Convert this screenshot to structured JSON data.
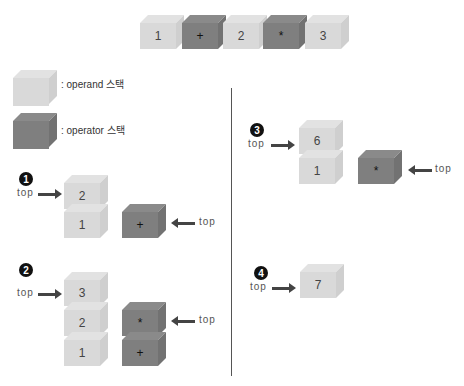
{
  "expression": {
    "tokens": [
      {
        "value": "1",
        "kind": "operand"
      },
      {
        "value": "+",
        "kind": "operator"
      },
      {
        "value": "2",
        "kind": "operand"
      },
      {
        "value": "*",
        "kind": "operator"
      },
      {
        "value": "3",
        "kind": "operand"
      }
    ]
  },
  "legend": {
    "operand_label": ": operand 스택",
    "operator_label": ": operator 스택"
  },
  "colors": {
    "operand": "#d9d9d9",
    "operator": "#7f7f7f"
  },
  "top_label": "top",
  "steps": [
    {
      "number": "1",
      "operand_stack": [
        "2",
        "1"
      ],
      "operator_stack": [
        "+"
      ]
    },
    {
      "number": "2",
      "operand_stack": [
        "3",
        "2",
        "1"
      ],
      "operator_stack": [
        "*",
        "+"
      ]
    },
    {
      "number": "3",
      "operand_stack": [
        "6",
        "1"
      ],
      "operator_stack": [
        "*"
      ]
    },
    {
      "number": "4",
      "operand_stack": [
        "7"
      ],
      "operator_stack": []
    }
  ]
}
